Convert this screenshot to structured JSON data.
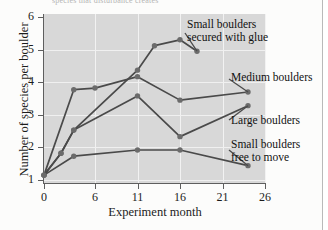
{
  "figure": {
    "cropped_title": "species that disturbance creates",
    "background_color": "#d8d8d8",
    "line_color": "#4a4a4a",
    "marker_color": "#6b6b6b"
  },
  "chart_data": {
    "type": "line",
    "title": "",
    "xlabel": "Experiment month",
    "ylabel": "Number of species per boulder",
    "xlim": [
      0,
      26
    ],
    "ylim": [
      0.6,
      6
    ],
    "xticks": [
      0,
      6,
      11,
      16,
      21,
      26
    ],
    "yticks": [
      1,
      2,
      3,
      4,
      5,
      6
    ],
    "grid": true,
    "legend_position": "annotations-right",
    "series": [
      {
        "name": "Small boulders secured with glue",
        "x": [
          0,
          2,
          3.5,
          11,
          13,
          16,
          18
        ],
        "values": [
          1.15,
          1.82,
          2.53,
          4.37,
          5.12,
          5.3,
          4.95
        ]
      },
      {
        "name": "Medium boulders",
        "x": [
          0,
          3.5,
          6,
          11,
          16,
          24
        ],
        "values": [
          1.15,
          3.77,
          3.82,
          4.17,
          3.45,
          3.7
        ]
      },
      {
        "name": "Large boulders",
        "x": [
          0,
          2,
          3.5,
          11,
          16,
          24
        ],
        "values": [
          1.15,
          1.82,
          2.53,
          3.58,
          2.33,
          3.28
        ]
      },
      {
        "name": "Small boulders free to move",
        "x": [
          0,
          3.5,
          11,
          16,
          24
        ],
        "values": [
          1.15,
          1.73,
          1.92,
          1.92,
          1.44
        ]
      }
    ],
    "annotations": [
      {
        "id": "glue",
        "text_line1": "Small boulders",
        "text_line2": "secured with glue"
      },
      {
        "id": "medium",
        "text_line1": "Medium boulders",
        "text_line2": ""
      },
      {
        "id": "large",
        "text_line1": "Large boulders",
        "text_line2": ""
      },
      {
        "id": "smallfree",
        "text_line1": "Small boulders",
        "text_line2": "free to move"
      }
    ]
  }
}
